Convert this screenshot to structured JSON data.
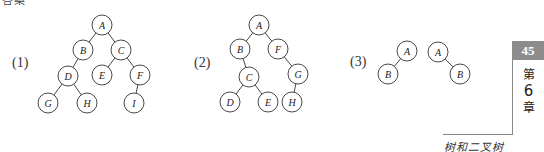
{
  "heading_cropped": "答案",
  "figures": [
    {
      "label": "(1)",
      "nodes": [
        {
          "id": "A",
          "x": 102,
          "y": 25
        },
        {
          "id": "B",
          "x": 83,
          "y": 50
        },
        {
          "id": "C",
          "x": 121,
          "y": 50
        },
        {
          "id": "D",
          "x": 68,
          "y": 76
        },
        {
          "id": "E",
          "x": 102,
          "y": 75
        },
        {
          "id": "F",
          "x": 140,
          "y": 75
        },
        {
          "id": "G",
          "x": 48,
          "y": 103
        },
        {
          "id": "H",
          "x": 87,
          "y": 103
        },
        {
          "id": "I",
          "x": 134,
          "y": 103
        }
      ],
      "edges": [
        [
          "A",
          "B"
        ],
        [
          "A",
          "C"
        ],
        [
          "B",
          "D"
        ],
        [
          "C",
          "E"
        ],
        [
          "C",
          "F"
        ],
        [
          "D",
          "G"
        ],
        [
          "D",
          "H"
        ],
        [
          "F",
          "I"
        ]
      ]
    },
    {
      "label": "(2)",
      "nodes": [
        {
          "id": "A",
          "x": 259,
          "y": 25
        },
        {
          "id": "B",
          "x": 240,
          "y": 49
        },
        {
          "id": "F",
          "x": 278,
          "y": 49
        },
        {
          "id": "C",
          "x": 249,
          "y": 77
        },
        {
          "id": "G",
          "x": 298,
          "y": 74
        },
        {
          "id": "D",
          "x": 230,
          "y": 102
        },
        {
          "id": "E",
          "x": 268,
          "y": 102
        },
        {
          "id": "H",
          "x": 292,
          "y": 102
        }
      ],
      "edges": [
        [
          "A",
          "B"
        ],
        [
          "A",
          "F"
        ],
        [
          "B",
          "C"
        ],
        [
          "F",
          "G"
        ],
        [
          "C",
          "D"
        ],
        [
          "C",
          "E"
        ],
        [
          "G",
          "H"
        ]
      ]
    },
    {
      "label": "(3)",
      "nodes": [
        {
          "id": "A",
          "x": 407,
          "y": 51
        },
        {
          "id": "B",
          "x": 388,
          "y": 74
        }
      ],
      "edges": [
        [
          "A",
          "B"
        ]
      ]
    },
    {
      "label": "",
      "nodes": [
        {
          "id": "A",
          "x": 438,
          "y": 52
        },
        {
          "id": "B",
          "x": 460,
          "y": 74
        }
      ],
      "edges": [
        [
          "A",
          "B"
        ]
      ]
    }
  ],
  "node_radius": 10,
  "sidebar": {
    "page_number": "45",
    "page_box_color": "#8c8c8c",
    "chapter_prefix": "第",
    "chapter_number": "6",
    "chapter_suffix": "章",
    "chapter_title": "树和二叉树"
  }
}
